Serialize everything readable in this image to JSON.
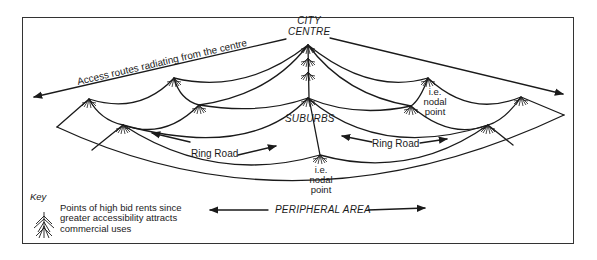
{
  "diagram": {
    "labels": {
      "city_centre_line1": "CITY",
      "city_centre_line2": "CENTRE",
      "access_routes": "Access routes radiating from the centre",
      "suburbs": "SUBURBS",
      "nodal_point_right": [
        "i.e.",
        "nodal",
        "point"
      ],
      "nodal_point_bottom": [
        "i.e.",
        "nodal",
        "point"
      ],
      "ring_road_left": "Ring  Road",
      "ring_road_right": "Ring  Road",
      "peripheral_area": "PERIPHERAL AREA"
    },
    "key": {
      "title": "Key",
      "icon": "branching-node-icon",
      "description": "Points of high bid rents since greater accessibility attracts commercial uses"
    },
    "colors": {
      "line": "#1a1a1a",
      "background": "#ffffff",
      "frame": "#333333"
    }
  }
}
